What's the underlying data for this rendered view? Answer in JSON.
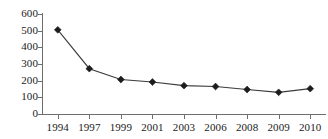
{
  "chart_data": {
    "type": "line",
    "title": "",
    "xlabel": "",
    "ylabel": "",
    "categories": [
      "1994",
      "1997",
      "1999",
      "2001",
      "2003",
      "2006",
      "2008",
      "2009",
      "2010"
    ],
    "values": [
      505,
      272,
      207,
      192,
      170,
      165,
      147,
      130,
      152
    ],
    "series": [
      {
        "name": "",
        "values": [
          505,
          272,
          207,
          192,
          170,
          165,
          147,
          130,
          152
        ]
      }
    ],
    "ylim": [
      0,
      600
    ],
    "ytick_labels": [
      "0",
      "100",
      "200",
      "300",
      "400",
      "500",
      "600"
    ],
    "ytick_values": [
      0,
      100,
      200,
      300,
      400,
      500,
      600
    ],
    "grid": false,
    "legend": "none",
    "marker": "diamond",
    "line_color": "#3a3a3a",
    "marker_color": "#1c1c1c",
    "axis_color": "#6e6e6e",
    "background": "#ffffff"
  }
}
